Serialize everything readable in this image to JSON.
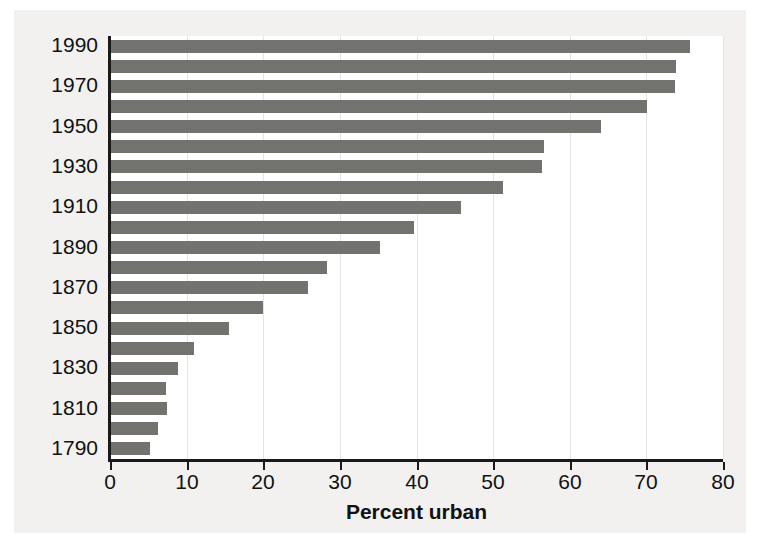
{
  "chart_data": {
    "type": "bar",
    "orientation": "horizontal",
    "title": "",
    "xlabel": "Percent urban",
    "ylabel": "",
    "xlim": [
      0,
      80
    ],
    "ylim": [
      1790,
      1990
    ],
    "grid": true,
    "legend": null,
    "bar_color": "#72726f",
    "plot_background": "#ffffff",
    "figure_background": "#f2f1ef",
    "axis_color": "#1a1a1a",
    "x_ticks": [
      0,
      10,
      20,
      30,
      40,
      50,
      60,
      70,
      80
    ],
    "x_tick_labels": [
      "0",
      "10",
      "20",
      "30",
      "40",
      "50",
      "60",
      "70",
      "80"
    ],
    "y_tick_labels": [
      "1990",
      "1970",
      "1950",
      "1930",
      "1910",
      "1890",
      "1870",
      "1850",
      "1830",
      "1810",
      "1790"
    ],
    "categories": [
      "1990",
      "1980",
      "1970",
      "1960",
      "1950",
      "1940",
      "1930",
      "1920",
      "1910",
      "1900",
      "1890",
      "1880",
      "1870",
      "1860",
      "1850",
      "1840",
      "1830",
      "1820",
      "1810",
      "1800",
      "1790"
    ],
    "values": [
      75.6,
      73.7,
      73.6,
      69.9,
      64.0,
      56.5,
      56.2,
      51.2,
      45.7,
      39.6,
      35.1,
      28.2,
      25.7,
      19.8,
      15.4,
      10.8,
      8.8,
      7.2,
      7.3,
      6.1,
      5.1
    ]
  }
}
